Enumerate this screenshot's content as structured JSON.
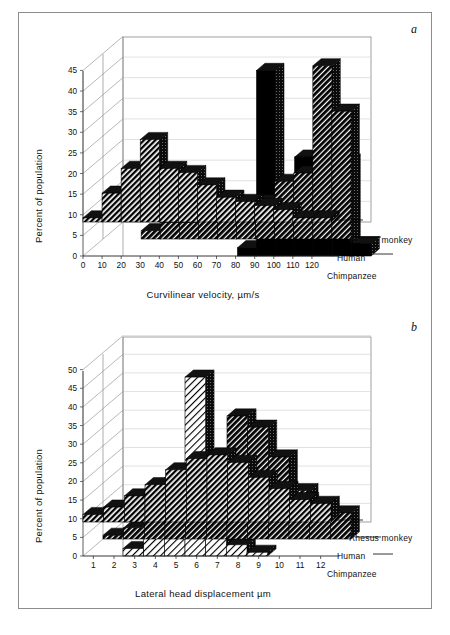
{
  "figure": {
    "background_color": "#ffffff",
    "frame_color": "#8d8d8d"
  },
  "panels": [
    {
      "letter": "a",
      "ylabel": "Percent of population",
      "xlabel": "Curvilinear velocity, µm/s"
    },
    {
      "letter": "b",
      "ylabel": "Percent of population",
      "xlabel": "Lateral head displacement µm"
    }
  ],
  "series_names": {
    "back": "Rhesus monkey",
    "middle": "Human",
    "front": "Chimpanzee"
  },
  "chart_data": [
    {
      "type": "bar",
      "subplot": "a",
      "title": "",
      "xlabel": "Curvilinear velocity, µm/s",
      "ylabel": "Percent of population",
      "categories": [
        "0",
        "10",
        "20",
        "30",
        "40",
        "50",
        "60",
        "70",
        "80",
        "90",
        "100",
        "110",
        "120"
      ],
      "xticklabels": [
        "0",
        "10",
        "20",
        "30",
        "40",
        "50",
        "60",
        "70",
        "80",
        "90",
        "100",
        "110",
        "120"
      ],
      "yticklabels": [
        "0",
        "5",
        "10",
        "15",
        "20",
        "25",
        "30",
        "35",
        "40",
        "45"
      ],
      "ylim": [
        0,
        47
      ],
      "xlim": [
        0,
        130
      ],
      "grid": true,
      "legend": [
        "Rhesus monkey",
        "Human",
        "Chimpanzee"
      ],
      "legend_position": "right-inside-3d-depth-axis",
      "projection": "3d-depth-rows",
      "series": [
        {
          "name": "Rhesus monkey",
          "fill": "solid-black",
          "values": [
            0,
            0,
            0,
            0,
            0,
            0,
            2,
            45,
            10,
            24,
            24,
            23,
            3
          ]
        },
        {
          "name": "Human",
          "fill": "dark-hatch",
          "values": [
            0,
            0,
            2,
            4,
            4,
            5,
            6,
            8,
            9,
            14,
            16,
            42,
            31
          ]
        },
        {
          "name": "Chimpanzee",
          "fill": "diagonal-hatch",
          "values": [
            1,
            7,
            13,
            20,
            13,
            12,
            9,
            6,
            5,
            4,
            3,
            1,
            1
          ]
        }
      ]
    },
    {
      "type": "bar",
      "subplot": "b",
      "title": "",
      "xlabel": "Lateral head displacement µm",
      "ylabel": "Percent of population",
      "categories": [
        "1",
        "2",
        "3",
        "4",
        "5",
        "6",
        "7",
        "8",
        "9",
        "10",
        "11",
        "12"
      ],
      "xticklabels": [
        "1",
        "2",
        "3",
        "4",
        "5",
        "6",
        "7",
        "8",
        "9",
        "10",
        "11",
        "12"
      ],
      "yticklabels": [
        "0",
        "5",
        "10",
        "15",
        "20",
        "25",
        "30",
        "35",
        "40",
        "45",
        "50"
      ],
      "ylim": [
        0,
        52
      ],
      "xlim": [
        0,
        12
      ],
      "grid": true,
      "legend": [
        "Rhesus monkey",
        "Human",
        "Chimpanzee"
      ],
      "legend_position": "right-inside-3d-depth-axis",
      "projection": "3d-depth-rows",
      "series": [
        {
          "name": "Rhesus monkey",
          "fill": "light-hatch",
          "values": [
            2,
            5,
            21,
            48,
            26,
            3,
            1,
            0,
            0,
            0,
            0,
            0
          ]
        },
        {
          "name": "Human",
          "fill": "dark-hatch",
          "values": [
            1,
            3,
            5,
            9,
            14,
            17,
            33,
            30,
            22,
            13,
            9,
            7
          ]
        },
        {
          "name": "Chimpanzee",
          "fill": "diagonal-hatch",
          "values": [
            2,
            4,
            7,
            10,
            14,
            17,
            18,
            16,
            12,
            9,
            6,
            5
          ]
        }
      ]
    }
  ]
}
